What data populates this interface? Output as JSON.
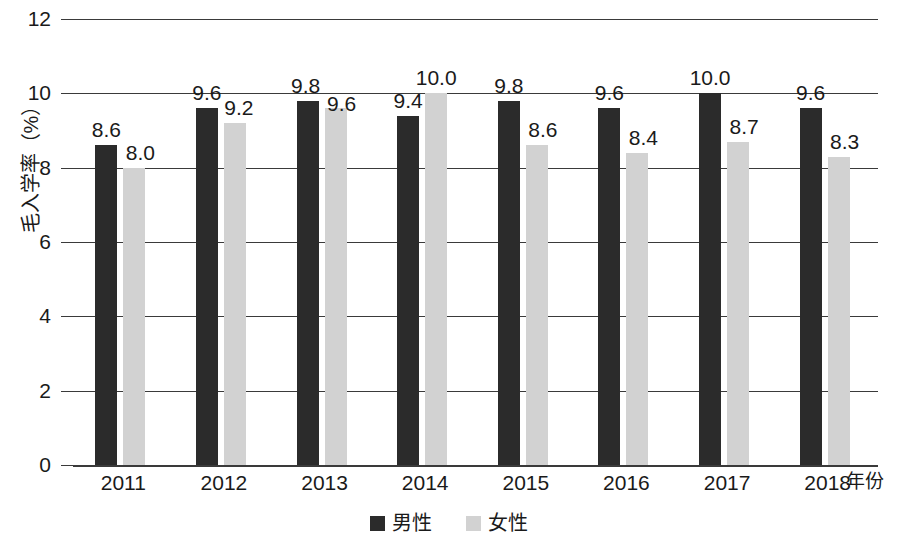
{
  "chart_data": {
    "type": "bar",
    "title": "",
    "subtitle": "",
    "xlabel": "年份",
    "ylabel": "毛入学率（%）",
    "categories": [
      "2011",
      "2012",
      "2013",
      "2014",
      "2015",
      "2016",
      "2017",
      "2018"
    ],
    "series": [
      {
        "name": "男性",
        "color": "#2b2b2b",
        "values": [
          8.6,
          9.6,
          9.8,
          9.4,
          9.8,
          9.6,
          10.0,
          9.6
        ],
        "labels": [
          "8.6",
          "9.6",
          "9.8",
          "9.4",
          "9.8",
          "9.6",
          "10.0",
          "9.6"
        ]
      },
      {
        "name": "女性",
        "color": "#d2d2d2",
        "values": [
          8.0,
          9.2,
          9.6,
          10.0,
          8.6,
          8.4,
          8.7,
          8.3
        ],
        "labels": [
          "8.0",
          "9.2",
          "9.6",
          "10.0",
          "8.6",
          "8.4",
          "8.7",
          "8.3"
        ]
      }
    ],
    "ylim": [
      0,
      12
    ],
    "ytick_labels": [
      "12",
      "10",
      "8",
      "6",
      "4",
      "2",
      "0"
    ],
    "ytick_values": [
      12,
      10,
      8,
      6,
      4,
      2,
      0
    ],
    "grid": true,
    "legend_position": "bottom",
    "legend": [
      "男性",
      "女性"
    ]
  }
}
